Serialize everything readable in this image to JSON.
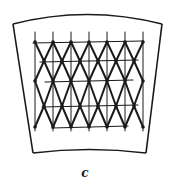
{
  "figure": {
    "label": "c",
    "stroke_color": "#1a1a1a",
    "background": "#ffffff",
    "frame": {
      "top_left": [
        13,
        24
      ],
      "top_right": [
        162,
        24
      ],
      "top_peak_y": 14,
      "bottom_left": [
        33,
        153
      ],
      "bottom_right": [
        146,
        153
      ],
      "bottom_peak_y": 149
    },
    "grid": {
      "columns_x": [
        35,
        53,
        71,
        89,
        107,
        125,
        143
      ],
      "rows_y": [
        42,
        61,
        81,
        106,
        127
      ],
      "row_x_extents": [
        [
          33,
          143
        ],
        [
          40,
          138
        ],
        [
          45,
          133
        ],
        [
          42,
          138
        ],
        [
          52,
          128
        ]
      ],
      "vertical_extent": [
        32,
        131
      ]
    }
  }
}
